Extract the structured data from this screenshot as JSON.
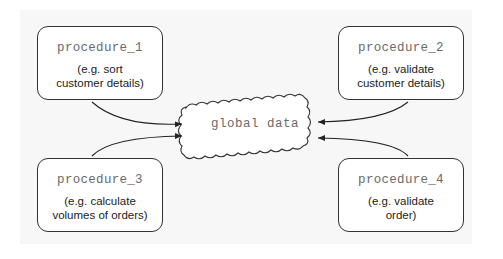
{
  "diagram": {
    "type": "data-flow",
    "central_node": {
      "label": "global data",
      "shape": "cloud"
    },
    "procedures": [
      {
        "name": "procedure_1",
        "description": "(e.g. sort\ncustomer details)"
      },
      {
        "name": "procedure_2",
        "description": "(e.g. validate\ncustomer details)"
      },
      {
        "name": "procedure_3",
        "description": "(e.g. calculate\nvolumes of orders)"
      },
      {
        "name": "procedure_4",
        "description": "(e.g. validate\norder)"
      }
    ],
    "edges": [
      {
        "from": "procedure_1",
        "to": "global data"
      },
      {
        "from": "procedure_2",
        "to": "global data"
      },
      {
        "from": "procedure_3",
        "to": "global data"
      },
      {
        "from": "procedure_4",
        "to": "global data"
      }
    ]
  }
}
